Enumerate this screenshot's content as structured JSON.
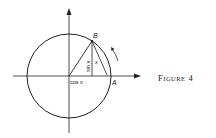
{
  "figure": {
    "caption_first": "F",
    "caption_rest": "IGURE",
    "caption_number": "4"
  },
  "labels": {
    "point_b": "B",
    "point_a": "A",
    "sin": "sin x",
    "cos": "cos x",
    "arc": "x"
  },
  "colors": {
    "ink": "#222222",
    "background": "#ffffff"
  }
}
